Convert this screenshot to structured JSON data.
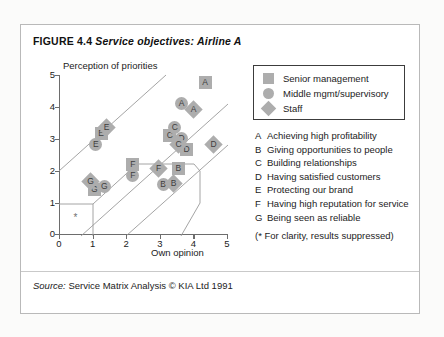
{
  "figure": {
    "number": "FIGURE 4.4",
    "title": "Service objectives: Airline A",
    "source_label": "Source:",
    "source_text": "Service Matrix Analysis © KIA Ltd 1991"
  },
  "legend": {
    "items": [
      {
        "symbol": "square",
        "label": "Senior management"
      },
      {
        "symbol": "circle",
        "label": "Middle mgmt/supervisory"
      },
      {
        "symbol": "diamond",
        "label": "Staff"
      }
    ]
  },
  "key": {
    "items": [
      {
        "code": "A",
        "text": "Achieving high profitability"
      },
      {
        "code": "B",
        "text": "Giving opportunities to people"
      },
      {
        "code": "C",
        "text": "Building relationships"
      },
      {
        "code": "D",
        "text": "Having satisfied customers"
      },
      {
        "code": "E",
        "text": "Protecting our brand"
      },
      {
        "code": "F",
        "text": "Having high reputation for service"
      },
      {
        "code": "G",
        "text": "Being seen as reliable"
      }
    ],
    "note": "(* For clarity, results suppressed)"
  },
  "chart_data": {
    "type": "scatter",
    "title": "Service objectives: Airline A",
    "xlabel": "Own opinion",
    "ylabel": "Perception of priorities",
    "xlim": [
      0,
      5
    ],
    "ylim": [
      0,
      5
    ],
    "xticks": [
      0,
      1,
      2,
      3,
      4,
      5
    ],
    "yticks": [
      0,
      1,
      2,
      3,
      4,
      5
    ],
    "grid": false,
    "legend_position": "right",
    "series": [
      {
        "name": "Senior management",
        "symbol": "square",
        "points": [
          {
            "label": "A",
            "x": 4.35,
            "y": 4.75
          },
          {
            "label": "B",
            "x": 3.55,
            "y": 2.05
          },
          {
            "label": "C",
            "x": 3.3,
            "y": 3.1
          },
          {
            "label": "D",
            "x": 3.8,
            "y": 2.65
          },
          {
            "label": "E",
            "x": 1.25,
            "y": 3.15
          },
          {
            "label": "F",
            "x": 2.2,
            "y": 2.2
          },
          {
            "label": "G",
            "x": 1.05,
            "y": 1.4
          }
        ]
      },
      {
        "name": "Middle mgmt/supervisory",
        "symbol": "circle",
        "points": [
          {
            "label": "A",
            "x": 3.65,
            "y": 4.1
          },
          {
            "label": "B",
            "x": 3.1,
            "y": 1.55
          },
          {
            "label": "C",
            "x": 3.45,
            "y": 3.35
          },
          {
            "label": "D",
            "x": 3.65,
            "y": 3.0
          },
          {
            "label": "E",
            "x": 1.1,
            "y": 2.8
          },
          {
            "label": "F",
            "x": 2.2,
            "y": 1.85
          },
          {
            "label": "G",
            "x": 1.35,
            "y": 1.5
          }
        ]
      },
      {
        "name": "Staff",
        "symbol": "diamond",
        "points": [
          {
            "label": "A",
            "x": 4.0,
            "y": 3.9
          },
          {
            "label": "B",
            "x": 3.4,
            "y": 1.6
          },
          {
            "label": "C",
            "x": 3.55,
            "y": 2.8
          },
          {
            "label": "D",
            "x": 4.6,
            "y": 2.8
          },
          {
            "label": "E",
            "x": 1.4,
            "y": 3.35
          },
          {
            "label": "F",
            "x": 2.95,
            "y": 2.05
          },
          {
            "label": "G",
            "x": 0.95,
            "y": 1.65
          }
        ]
      }
    ],
    "suppressed_marker": {
      "symbol": "*",
      "x": 0.55,
      "y": 0.5
    }
  }
}
